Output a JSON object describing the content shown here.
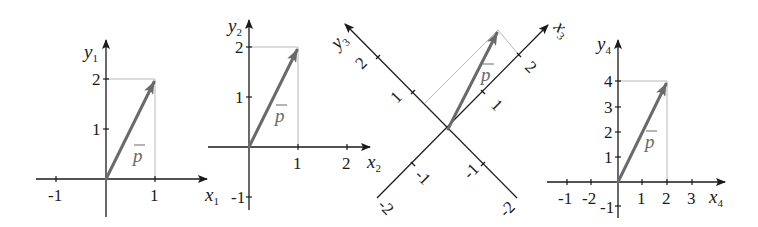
{
  "colors": {
    "axis": "#1a1a1a",
    "vector": "#6a6a6a",
    "helper_lines": "#b8b8b8",
    "background": "#ffffff"
  },
  "vector_label": "p",
  "diagrams": [
    {
      "name": "system-1",
      "x_axis": {
        "label": "x",
        "subscript": "1",
        "ticks": [
          "-1",
          "1"
        ]
      },
      "y_axis": {
        "label": "y",
        "subscript": "1",
        "ticks": [
          "1",
          "2"
        ]
      },
      "vector_components": [
        1,
        2
      ]
    },
    {
      "name": "system-2",
      "x_axis": {
        "label": "x",
        "subscript": "2",
        "ticks": [
          "1",
          "2"
        ]
      },
      "y_axis": {
        "label": "y",
        "subscript": "2",
        "ticks": [
          "-1",
          "1",
          "2"
        ]
      },
      "vector_components": [
        1,
        2
      ]
    },
    {
      "name": "system-3-rotated",
      "x_axis": {
        "label": "x",
        "subscript": "3",
        "ticks": [
          "-2",
          "-1",
          "1",
          "2"
        ]
      },
      "y_axis": {
        "label": "y",
        "subscript": "3",
        "ticks": [
          "-2",
          "-1",
          "1",
          "2"
        ]
      },
      "rotation_deg": 45
    },
    {
      "name": "system-4",
      "x_axis": {
        "label": "x",
        "subscript": "4",
        "ticks": [
          "-1",
          "-2",
          "1",
          "2",
          "3"
        ]
      },
      "y_axis": {
        "label": "y",
        "subscript": "4",
        "ticks": [
          "-1",
          "1",
          "2",
          "3",
          "4"
        ]
      },
      "vector_components": [
        2,
        4
      ]
    }
  ]
}
